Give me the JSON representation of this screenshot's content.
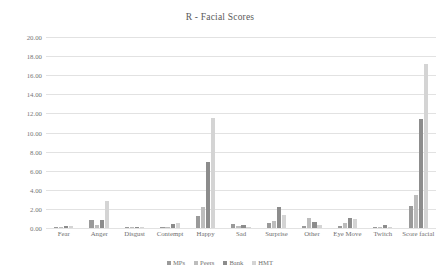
{
  "chart_data": {
    "type": "bar",
    "title": "R - Facial Scores",
    "xlabel": "",
    "ylabel": "",
    "ylim": [
      0,
      20
    ],
    "ytick_step": 2,
    "ytick_labels": [
      "20.00",
      "18.00",
      "16.00",
      "14.00",
      "12.00",
      "10.00",
      "8.00",
      "6.00",
      "4.00",
      "2.00",
      "0.00"
    ],
    "grid": true,
    "legend_position": "bottom",
    "categories": [
      "Fear",
      "Anger",
      "Disgust",
      "Contempt",
      "Happy",
      "Sad",
      "Surprise",
      "Other",
      "Eye Move",
      "Twitch",
      "Score facial"
    ],
    "series": [
      {
        "name": "MPs",
        "color": "#9a9a9a",
        "values": [
          0.15,
          0.85,
          0.1,
          0.05,
          1.3,
          0.4,
          0.55,
          0.25,
          0.2,
          0.1,
          2.3
        ]
      },
      {
        "name": "Peers",
        "color": "#bdbdbd",
        "values": [
          0.1,
          0.35,
          0.05,
          0.05,
          2.2,
          0.2,
          0.7,
          1.05,
          0.55,
          0.0,
          3.5
        ]
      },
      {
        "name": "Bank",
        "color": "#8c8c8c",
        "values": [
          0.2,
          0.8,
          0.15,
          0.4,
          6.9,
          0.35,
          2.15,
          0.65,
          1.05,
          0.3,
          11.4
        ]
      },
      {
        "name": "HMT",
        "color": "#d4d4d4",
        "values": [
          0.25,
          2.8,
          0.1,
          0.55,
          11.5,
          0.15,
          1.35,
          0.3,
          0.9,
          0.05,
          17.2
        ]
      }
    ]
  }
}
